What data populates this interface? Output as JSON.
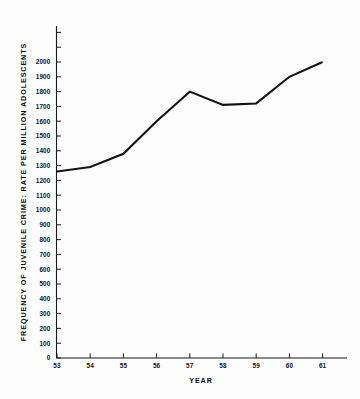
{
  "chart_data": {
    "type": "line",
    "title": "",
    "xlabel": "YEAR",
    "ylabel": "FREQUENCY OF JUVENILE CRIME: RATE PER MILLION ADOLESCENTS",
    "categories": [
      "53",
      "54",
      "55",
      "56",
      "57",
      "58",
      "59",
      "60",
      "61"
    ],
    "x": [
      53,
      54,
      55,
      56,
      57,
      58,
      59,
      60,
      61
    ],
    "values": [
      1260,
      1290,
      1380,
      1600,
      1800,
      1710,
      1720,
      1900,
      2000
    ],
    "series": [
      {
        "name": "Juvenile crime rate per million adolescents",
        "values": [
          1260,
          1290,
          1380,
          1600,
          1800,
          1710,
          1720,
          1900,
          2000
        ]
      }
    ],
    "xlim": [
      53,
      62
    ],
    "ylim": [
      0,
      2000
    ],
    "ytick_labels": [
      "0",
      "100",
      "200",
      "300",
      "400",
      "500",
      "600",
      "700",
      "800",
      "900",
      "1000",
      "1100",
      "1200",
      "1300",
      "1400",
      "1500",
      "1600",
      "1700",
      "1800",
      "1900",
      "2000"
    ],
    "ytick_values": [
      0,
      100,
      200,
      300,
      400,
      500,
      600,
      700,
      800,
      900,
      1000,
      1100,
      1200,
      1300,
      1400,
      1500,
      1600,
      1700,
      1800,
      1900,
      2000
    ],
    "xtick_labels": [
      "53",
      "54",
      "55",
      "56",
      "57",
      "58",
      "59",
      "60",
      "61"
    ],
    "grid": false,
    "legend": "none",
    "line_color": "#15130f",
    "axis_color": "#1a1a1a",
    "background_color": "#fdfdfd"
  },
  "figure": {
    "x_axis_title": "YEAR",
    "y_axis_title": "FREQUENCY OF JUVENILE CRIME: RATE PER MILLION ADOLESCENTS"
  }
}
